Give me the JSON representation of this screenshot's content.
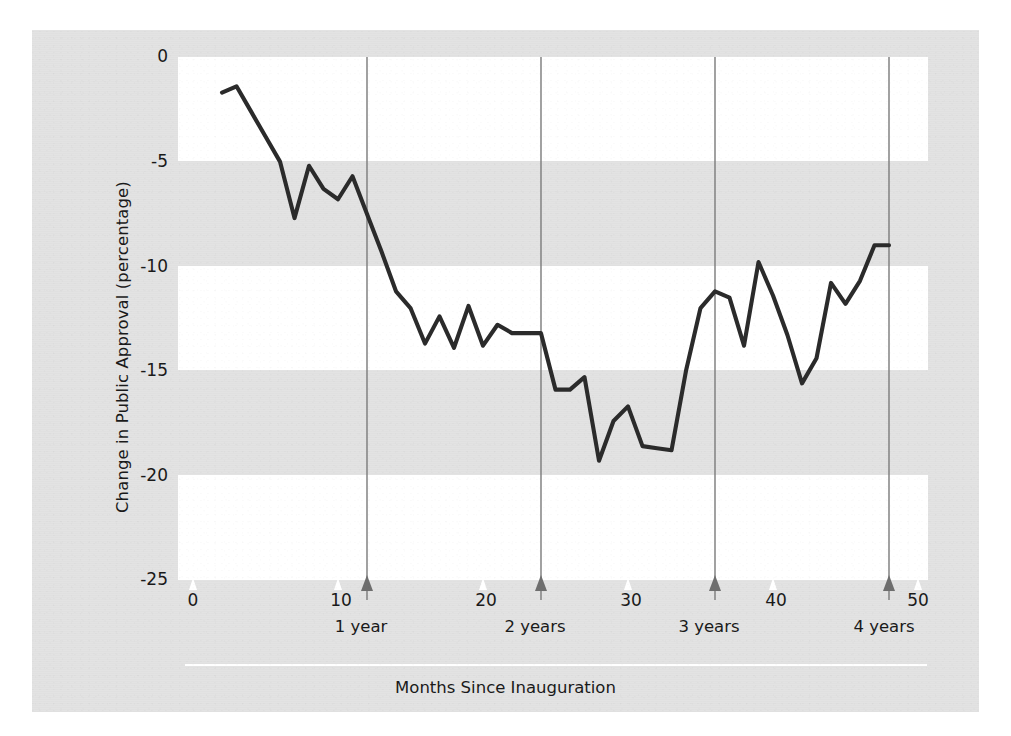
{
  "chart_data": {
    "type": "line",
    "title": "",
    "xlabel": "Months Since Inauguration",
    "ylabel": "Change in Public Approval (percentage)",
    "xlim": [
      0,
      50
    ],
    "ylim": [
      -25,
      0
    ],
    "grid": "horizontal-alternating-bands",
    "legend": null,
    "y_ticks": [
      "0",
      "-5",
      "-10",
      "-15",
      "-20",
      "-25"
    ],
    "y_tick_values": [
      0,
      -5,
      -10,
      -15,
      -20,
      -25
    ],
    "x_ticks": [
      "0",
      "10",
      "20",
      "30",
      "40",
      "50"
    ],
    "x_tick_values": [
      0,
      10,
      20,
      30,
      40,
      50
    ],
    "annotations": [
      {
        "label": "1 year",
        "x": 12
      },
      {
        "label": "2 years",
        "x": 24
      },
      {
        "label": "3 years",
        "x": 36
      },
      {
        "label": "4 years",
        "x": 48
      }
    ],
    "series": [
      {
        "name": "Change in Public Approval",
        "color": "#2b2b2b",
        "x": [
          2,
          3,
          4,
          5,
          6,
          7,
          8,
          9,
          10,
          11,
          12,
          13,
          14,
          15,
          16,
          17,
          18,
          19,
          20,
          21,
          22,
          23,
          24,
          25,
          26,
          27,
          28,
          29,
          30,
          31,
          32,
          33,
          34,
          35,
          36,
          37,
          38,
          39,
          40,
          41,
          42,
          43,
          44,
          45,
          46,
          47,
          48
        ],
        "values": [
          -1.7,
          -1.4,
          -2.6,
          -3.8,
          -5.0,
          -7.7,
          -5.2,
          -6.3,
          -6.8,
          -5.7,
          -7.5,
          -9.3,
          -11.2,
          -12.0,
          -13.7,
          -12.4,
          -13.9,
          -11.9,
          -13.8,
          -12.8,
          -13.2,
          -13.2,
          -13.2,
          -15.9,
          -15.9,
          -15.3,
          -19.3,
          -17.4,
          -16.7,
          -18.6,
          -18.7,
          -18.8,
          -15.0,
          -12.0,
          -11.2,
          -11.5,
          -13.8,
          -9.8,
          -11.4,
          -13.3,
          -15.6,
          -14.4,
          -10.8,
          -11.8,
          -10.7,
          -9.0,
          -9.0
        ]
      }
    ]
  },
  "axis": {
    "y_title": "Change in Public Approval (percentage)",
    "x_title": "Months Since Inauguration"
  },
  "year_markers": [
    {
      "label": "1 year"
    },
    {
      "label": "2 years"
    },
    {
      "label": "3 years"
    },
    {
      "label": "4 years"
    }
  ]
}
